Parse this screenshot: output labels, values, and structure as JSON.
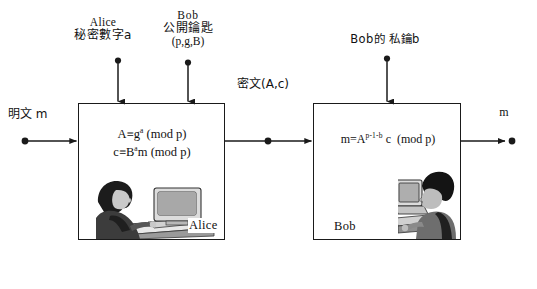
{
  "diagram": {
    "line_color": "#1a1a1a",
    "box_border_color": "#1a1a1a",
    "background": "#ffffff"
  },
  "inputs": {
    "alice_secret": {
      "line1": "Alice",
      "line2": "秘密數字a"
    },
    "bob_public": {
      "line1": "Bob",
      "line2": "公開鑰匙",
      "line3": "(p,g,B)"
    },
    "bob_private": {
      "label": "Bob的 私鑰b"
    },
    "plaintext": {
      "label": "明文 m"
    }
  },
  "channel": {
    "ciphertext_label": "密文(A,c)"
  },
  "output": {
    "label": "m"
  },
  "alice_block": {
    "name": "Alice",
    "formula_line1_lhs": "A",
    "formula_line1_op": "≡",
    "formula_line1_base": "g",
    "formula_line1_exp": "a",
    "formula_line1_mod": "(mod p)",
    "formula_line2_lhs": "c",
    "formula_line2_op": "≡",
    "formula_line2_base": "B",
    "formula_line2_exp": "a",
    "formula_line2_tail": "m",
    "formula_line2_mod": "(mod p)",
    "formula_text": "A≡g^a (mod p) ; c≡B^a m (mod p)"
  },
  "bob_block": {
    "name": "Bob",
    "formula_lhs": "m",
    "formula_op": "=",
    "formula_base": "A",
    "formula_exp": "p-1-b",
    "formula_tail": "c",
    "formula_mod": "(mod p)",
    "formula_text": "m = A^(p-1-b) c (mod p)"
  },
  "illustrations": {
    "alice": "person-at-crt-computer-illustration",
    "bob": "person-at-crt-computer-illustration"
  }
}
